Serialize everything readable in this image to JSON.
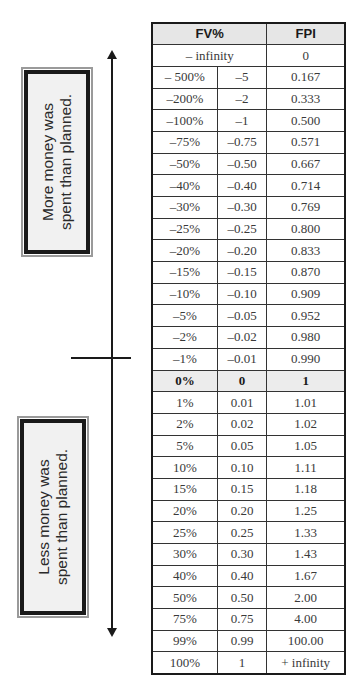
{
  "labels": {
    "top": [
      "More money was",
      "spent  than planned."
    ],
    "bottom": [
      "Less money was",
      "spent than planned."
    ]
  },
  "table": {
    "headers": {
      "fv": "FV%",
      "fpi": "FPI"
    },
    "first_row": {
      "fv": "– infinity",
      "fpi": "0"
    },
    "rows": [
      [
        "– 500%",
        "–5",
        "0.167"
      ],
      [
        "–200%",
        "–2",
        "0.333"
      ],
      [
        "–100%",
        "–1",
        "0.500"
      ],
      [
        "–75%",
        "–0.75",
        "0.571"
      ],
      [
        "–50%",
        "–0.50",
        "0.667"
      ],
      [
        "–40%",
        "–0.40",
        "0.714"
      ],
      [
        "–30%",
        "–0.30",
        "0.769"
      ],
      [
        "–25%",
        "–0.25",
        "0.800"
      ],
      [
        "–20%",
        "–0.20",
        "0.833"
      ],
      [
        "–15%",
        "–0.15",
        "0.870"
      ],
      [
        "–10%",
        "–0.10",
        "0.909"
      ],
      [
        "–5%",
        "–0.05",
        "0.952"
      ],
      [
        "–2%",
        "–0.02",
        "0.980"
      ],
      [
        "–1%",
        "–0.01",
        "0.990"
      ],
      [
        "0%",
        "0",
        "1"
      ],
      [
        "1%",
        "0.01",
        "1.01"
      ],
      [
        "2%",
        "0.02",
        "1.02"
      ],
      [
        "5%",
        "0.05",
        "1.05"
      ],
      [
        "10%",
        "0.10",
        "1.11"
      ],
      [
        "15%",
        "0.15",
        "1.18"
      ],
      [
        "20%",
        "0.20",
        "1.25"
      ],
      [
        "25%",
        "0.25",
        "1.33"
      ],
      [
        "30%",
        "0.30",
        "1.43"
      ],
      [
        "40%",
        "0.40",
        "1.67"
      ],
      [
        "50%",
        "0.50",
        "2.00"
      ],
      [
        "75%",
        "0.75",
        "4.00"
      ],
      [
        "99%",
        "0.99",
        "100.00"
      ],
      [
        "100%",
        "1",
        "+ infinity"
      ]
    ],
    "zero_row_index": 14
  }
}
